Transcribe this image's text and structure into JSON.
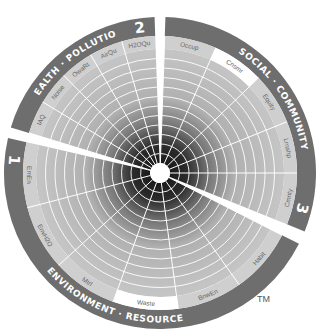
{
  "diagram": {
    "center": [
      160,
      173
    ],
    "colors": {
      "band": "#6e6e6e",
      "band_text": "#ffffff",
      "label_ring": "#cfcfcf",
      "label_ring_highlight": "#ffffff",
      "grid_line": "#ffffff",
      "ring_light": "#bdbdbd",
      "ring_dark": "#1e1e1e",
      "divider": "#5a5a5a"
    },
    "sectors": [
      {
        "number": "2",
        "title": "HEALTH · POLLUTION",
        "start_deg": 197,
        "end_deg": 268,
        "labels": [
          "IAQ",
          "Noise",
          "OwaRt",
          "AirQu",
          "H2OQu"
        ],
        "highlighted": []
      },
      {
        "number": "3",
        "title": "SOCIAL · COMMUNITY",
        "start_deg": 272,
        "end_deg": 382,
        "labels": [
          "Occup",
          "Cnsmr",
          "Equity",
          "Lrnshp",
          "Cmnty"
        ],
        "highlighted": [
          "Cnsmr"
        ]
      },
      {
        "number": "1",
        "title": "ENVIRONMENT · RESOURCE",
        "start_deg": 27,
        "end_deg": 193,
        "labels": [
          "Habit",
          "BnwEn",
          "Waste",
          "Mtrl",
          "EnvH2O",
          "EmEn"
        ],
        "highlighted": [
          "Waste"
        ]
      }
    ],
    "rings": 11,
    "trademark": "TM"
  }
}
